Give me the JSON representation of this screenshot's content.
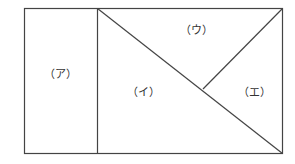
{
  "diagram": {
    "labels": {
      "a": "（ア）",
      "i": "（イ）",
      "u": "（ウ）",
      "e": "（エ）"
    },
    "stroke_color": "#444444"
  }
}
